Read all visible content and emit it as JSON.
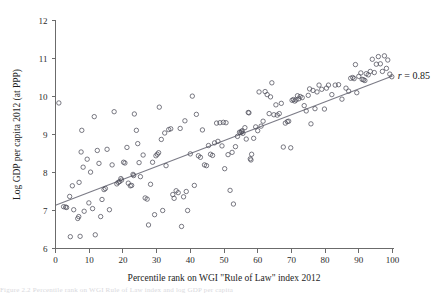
{
  "figure": {
    "caption_fragment": "Figure 2.2  Percentile rank on WGI Rule of Law index and log GDP per capita"
  },
  "chart_data": {
    "type": "scatter",
    "title": "",
    "xlabel": "Percentile rank on WGI \"Rule of Law\" index 2012",
    "ylabel": "Log GDP per capita  2012 (at PPP)",
    "xlim": [
      0,
      100
    ],
    "ylim": [
      6,
      12
    ],
    "xticks": [
      0,
      10,
      20,
      30,
      40,
      50,
      60,
      70,
      80,
      90,
      100
    ],
    "yticks": [
      6,
      7,
      8,
      9,
      10,
      11,
      12
    ],
    "grid": false,
    "legend": null,
    "annotations": [
      {
        "text_italic": "r",
        "text": " = 0.85",
        "x": 101,
        "y": 10.55
      }
    ],
    "marker": {
      "shape": "open-circle",
      "radius_px": 2.2,
      "color": "#4d4d5a"
    },
    "fit_line": {
      "type": "linear",
      "color": "#7b7b86",
      "x_start": 0,
      "y_start": 7.14,
      "x_end": 100,
      "y_end": 10.54
    },
    "series": [
      {
        "name": "countries",
        "points": [
          [
            1.0,
            9.83
          ],
          [
            2.4,
            7.1
          ],
          [
            3.0,
            7.09
          ],
          [
            3.3,
            7.08
          ],
          [
            4.2,
            7.37
          ],
          [
            4.4,
            6.31
          ],
          [
            5.0,
            7.65
          ],
          [
            5.4,
            7.02
          ],
          [
            6.6,
            6.79
          ],
          [
            6.9,
            6.84
          ],
          [
            7.0,
            7.74
          ],
          [
            7.3,
            6.32
          ],
          [
            7.6,
            8.54
          ],
          [
            7.8,
            9.11
          ],
          [
            8.2,
            8.14
          ],
          [
            8.5,
            6.98
          ],
          [
            9.4,
            8.35
          ],
          [
            9.9,
            7.2
          ],
          [
            10.4,
            8.01
          ],
          [
            11.0,
            7.05
          ],
          [
            11.5,
            9.47
          ],
          [
            11.8,
            6.36
          ],
          [
            12.4,
            8.58
          ],
          [
            12.9,
            8.24
          ],
          [
            13.4,
            6.84
          ],
          [
            13.8,
            7.29
          ],
          [
            14.4,
            7.55
          ],
          [
            14.8,
            7.58
          ],
          [
            15.3,
            8.61
          ],
          [
            16.0,
            7.02
          ],
          [
            16.8,
            8.2
          ],
          [
            17.4,
            9.6
          ],
          [
            18.2,
            7.7
          ],
          [
            18.6,
            7.74
          ],
          [
            19.0,
            7.76
          ],
          [
            19.4,
            7.84
          ],
          [
            19.6,
            7.8
          ],
          [
            20.2,
            8.27
          ],
          [
            20.6,
            8.25
          ],
          [
            21.2,
            8.66
          ],
          [
            21.6,
            7.72
          ],
          [
            22.2,
            7.65
          ],
          [
            22.6,
            7.66
          ],
          [
            23.0,
            7.95
          ],
          [
            23.2,
            7.92
          ],
          [
            23.4,
            9.54
          ],
          [
            24.0,
            9.11
          ],
          [
            24.4,
            8.76
          ],
          [
            24.8,
            8.26
          ],
          [
            25.2,
            7.89
          ],
          [
            26.0,
            8.46
          ],
          [
            26.6,
            7.33
          ],
          [
            27.2,
            7.3
          ],
          [
            27.6,
            6.62
          ],
          [
            28.2,
            7.69
          ],
          [
            28.8,
            8.27
          ],
          [
            29.4,
            6.89
          ],
          [
            29.8,
            8.44
          ],
          [
            30.2,
            8.48
          ],
          [
            30.6,
            8.52
          ],
          [
            30.8,
            9.72
          ],
          [
            31.4,
            8.87
          ],
          [
            31.8,
            7.0
          ],
          [
            32.4,
            9.04
          ],
          [
            32.8,
            8.18
          ],
          [
            33.6,
            9.13
          ],
          [
            34.2,
            9.15
          ],
          [
            34.8,
            7.42
          ],
          [
            35.2,
            7.32
          ],
          [
            35.8,
            7.52
          ],
          [
            36.4,
            7.47
          ],
          [
            37.0,
            9.16
          ],
          [
            37.4,
            6.58
          ],
          [
            38.0,
            7.36
          ],
          [
            38.4,
            9.36
          ],
          [
            38.8,
            7.5
          ],
          [
            39.2,
            7.0
          ],
          [
            40.0,
            8.49
          ],
          [
            40.6,
            10.01
          ],
          [
            41.2,
            7.66
          ],
          [
            41.8,
            9.53
          ],
          [
            42.4,
            8.44
          ],
          [
            43.0,
            8.4
          ],
          [
            43.6,
            9.12
          ],
          [
            44.2,
            8.2
          ],
          [
            44.8,
            8.18
          ],
          [
            45.4,
            8.71
          ],
          [
            46.0,
            8.48
          ],
          [
            46.6,
            8.45
          ],
          [
            47.2,
            8.78
          ],
          [
            47.8,
            9.3
          ],
          [
            48.2,
            8.82
          ],
          [
            48.8,
            9.31
          ],
          [
            49.4,
            8.7
          ],
          [
            49.8,
            9.32
          ],
          [
            50.2,
            8.1
          ],
          [
            50.6,
            9.31
          ],
          [
            51.2,
            8.47
          ],
          [
            51.8,
            7.53
          ],
          [
            52.4,
            8.53
          ],
          [
            52.8,
            7.17
          ],
          [
            53.4,
            8.68
          ],
          [
            54.0,
            8.95
          ],
          [
            54.6,
            9.06
          ],
          [
            55.0,
            9.05
          ],
          [
            55.2,
            9.08
          ],
          [
            55.4,
            9.1
          ],
          [
            55.6,
            9.03
          ],
          [
            56.2,
            9.18
          ],
          [
            56.6,
            8.88
          ],
          [
            57.2,
            9.58
          ],
          [
            57.4,
            9.57
          ],
          [
            57.8,
            8.36
          ],
          [
            58.0,
            8.33
          ],
          [
            58.2,
            8.48
          ],
          [
            58.8,
            8.9
          ],
          [
            59.4,
            9.2
          ],
          [
            60.0,
            9.1
          ],
          [
            60.4,
            10.12
          ],
          [
            61.0,
            9.22
          ],
          [
            61.6,
            9.35
          ],
          [
            62.2,
            10.13
          ],
          [
            62.8,
            10.05
          ],
          [
            63.4,
            9.55
          ],
          [
            63.8,
            9.99
          ],
          [
            64.2,
            10.36
          ],
          [
            64.8,
            9.52
          ],
          [
            65.4,
            9.78
          ],
          [
            65.8,
            9.51
          ],
          [
            66.4,
            9.55
          ],
          [
            67.0,
            9.82
          ],
          [
            67.6,
            8.67
          ],
          [
            68.2,
            9.3
          ],
          [
            68.8,
            9.34
          ],
          [
            69.2,
            9.35
          ],
          [
            69.8,
            8.65
          ],
          [
            70.2,
            9.9
          ],
          [
            70.6,
            9.92
          ],
          [
            71.0,
            9.88
          ],
          [
            71.4,
            9.91
          ],
          [
            71.8,
            10.02
          ],
          [
            72.2,
            9.94
          ],
          [
            72.6,
            10.0
          ],
          [
            73.2,
            9.97
          ],
          [
            73.8,
            9.76
          ],
          [
            74.4,
            9.62
          ],
          [
            75.0,
            10.03
          ],
          [
            75.4,
            10.2
          ],
          [
            75.8,
            9.28
          ],
          [
            76.4,
            10.16
          ],
          [
            77.0,
            9.68
          ],
          [
            77.6,
            10.12
          ],
          [
            78.2,
            10.3
          ],
          [
            79.0,
            10.19
          ],
          [
            79.8,
            9.67
          ],
          [
            80.4,
            10.22
          ],
          [
            81.0,
            10.3
          ],
          [
            82.0,
            10.05
          ],
          [
            83.0,
            10.3
          ],
          [
            84.0,
            10.31
          ],
          [
            85.0,
            9.93
          ],
          [
            86.2,
            10.22
          ],
          [
            87.0,
            10.14
          ],
          [
            87.6,
            10.48
          ],
          [
            88.2,
            10.5
          ],
          [
            88.6,
            10.47
          ],
          [
            89.0,
            10.84
          ],
          [
            89.4,
            10.1
          ],
          [
            90.0,
            10.53
          ],
          [
            90.6,
            10.62
          ],
          [
            91.0,
            10.45
          ],
          [
            91.4,
            10.44
          ],
          [
            91.8,
            10.42
          ],
          [
            92.2,
            10.6
          ],
          [
            92.8,
            10.57
          ],
          [
            93.4,
            10.66
          ],
          [
            94.0,
            10.98
          ],
          [
            94.6,
            10.63
          ],
          [
            95.2,
            10.85
          ],
          [
            95.8,
            11.05
          ],
          [
            96.4,
            10.86
          ],
          [
            97.0,
            10.66
          ],
          [
            97.6,
            11.07
          ],
          [
            98.2,
            10.74
          ],
          [
            98.6,
            10.96
          ],
          [
            99.2,
            10.59
          ],
          [
            99.8,
            10.52
          ]
        ]
      }
    ]
  }
}
